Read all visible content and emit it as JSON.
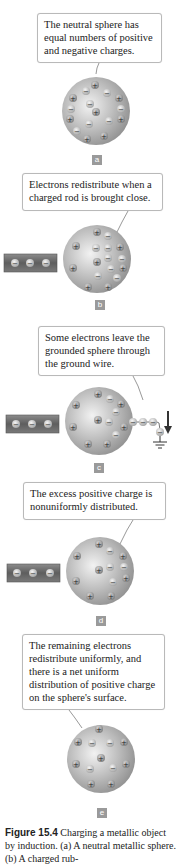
{
  "figure": {
    "number_label": "Figure 15.4",
    "caption_text": " Charging a metallic object by induction. (a) A neutral metallic sphere. (b) A charged rub-"
  },
  "panels": [
    {
      "id": "a",
      "label": "a",
      "callout": "The neutral sphere has equal numbers of positive and negative charges.",
      "has_rod": false,
      "grounded": false
    },
    {
      "id": "b",
      "label": "b",
      "callout": "Electrons redistribute when a charged rod is brought close.",
      "has_rod": true,
      "grounded": false
    },
    {
      "id": "c",
      "label": "c",
      "callout": "Some electrons leave the grounded sphere through the ground wire.",
      "has_rod": true,
      "grounded": true
    },
    {
      "id": "d",
      "label": "d",
      "callout": "The excess positive charge is nonuniformly distributed.",
      "has_rod": true,
      "grounded": false
    },
    {
      "id": "e",
      "label": "e",
      "callout": "The remaining electrons redistribute uniformly, and there is a net uniform distribution of positive charge on the sphere's surface.",
      "has_rod": false,
      "grounded": false
    }
  ],
  "colors": {
    "sphere": "#a8a8a8",
    "sphere_highlight": "#ececec",
    "rod": "#6e6e6e",
    "label_box": "#9a9a9a",
    "callout_border": "#b9b9b9"
  }
}
